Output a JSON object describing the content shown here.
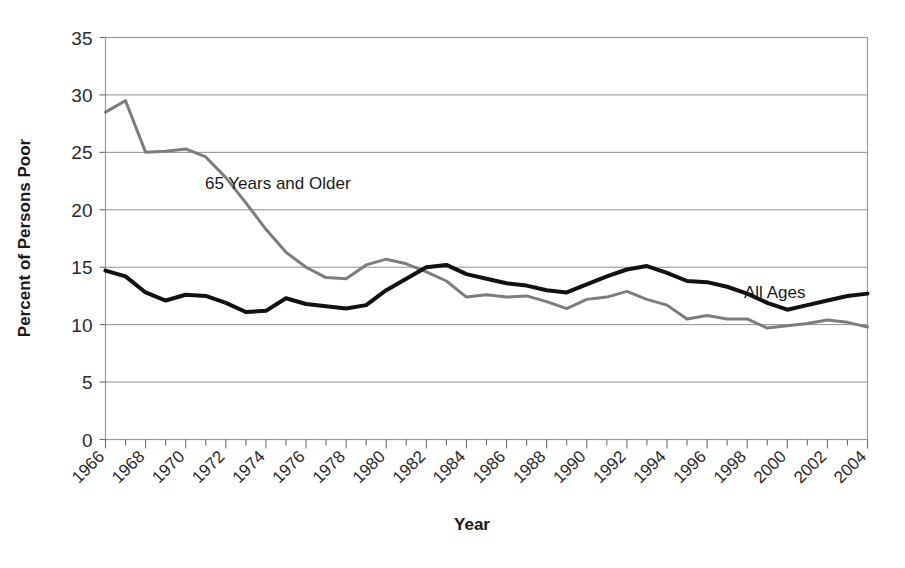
{
  "chart_data": {
    "type": "line",
    "title": "",
    "xlabel": "Year",
    "ylabel": "Percent of Persons Poor",
    "xlim": [
      1966,
      2004
    ],
    "ylim": [
      0,
      35
    ],
    "ytick_values": [
      0,
      5,
      10,
      15,
      20,
      25,
      30,
      35
    ],
    "ytick_labels": [
      "0",
      "5",
      "10",
      "15",
      "20",
      "25",
      "30",
      "35"
    ],
    "xtick_labels": [
      "1966",
      "1968",
      "1970",
      "1972",
      "1974",
      "1976",
      "1978",
      "1980",
      "1982",
      "1984",
      "1986",
      "1988",
      "1990",
      "1992",
      "1994",
      "1996",
      "1998",
      "2000",
      "2002",
      "2004"
    ],
    "xtick_values": [
      1966,
      1968,
      1970,
      1972,
      1974,
      1976,
      1978,
      1980,
      1982,
      1984,
      1986,
      1988,
      1990,
      1992,
      1994,
      1996,
      1998,
      2000,
      2002,
      2004
    ],
    "x": [
      1966,
      1967,
      1968,
      1969,
      1970,
      1971,
      1972,
      1973,
      1974,
      1975,
      1976,
      1977,
      1978,
      1979,
      1980,
      1981,
      1982,
      1983,
      1984,
      1985,
      1986,
      1987,
      1988,
      1989,
      1990,
      1991,
      1992,
      1993,
      1994,
      1995,
      1996,
      1997,
      1998,
      1999,
      2000,
      2001,
      2002,
      2003,
      2004
    ],
    "grid": true,
    "grid_axis": "y",
    "legend_position": "inline-annotation",
    "series": [
      {
        "name": "65 Years and Older",
        "color": "#7d7d7d",
        "linewidth": 3.0,
        "annotation_label": "65 Years and Older",
        "values": [
          28.5,
          29.5,
          25.0,
          25.1,
          25.3,
          24.6,
          22.8,
          20.6,
          18.3,
          16.3,
          15.0,
          14.1,
          14.0,
          15.2,
          15.7,
          15.3,
          14.6,
          13.8,
          12.4,
          12.6,
          12.4,
          12.5,
          12.0,
          11.4,
          12.2,
          12.4,
          12.9,
          12.2,
          11.7,
          10.5,
          10.8,
          10.5,
          10.5,
          9.7,
          9.9,
          10.1,
          10.4,
          10.2,
          9.8
        ]
      },
      {
        "name": "All Ages",
        "color": "#111111",
        "linewidth": 4.0,
        "annotation_label": "All Ages",
        "values": [
          14.7,
          14.2,
          12.8,
          12.1,
          12.6,
          12.5,
          11.9,
          11.1,
          11.2,
          12.3,
          11.8,
          11.6,
          11.4,
          11.7,
          13.0,
          14.0,
          15.0,
          15.2,
          14.4,
          14.0,
          13.6,
          13.4,
          13.0,
          12.8,
          13.5,
          14.2,
          14.8,
          15.1,
          14.5,
          13.8,
          13.7,
          13.3,
          12.7,
          11.9,
          11.3,
          11.7,
          12.1,
          12.5,
          12.7
        ]
      }
    ]
  }
}
